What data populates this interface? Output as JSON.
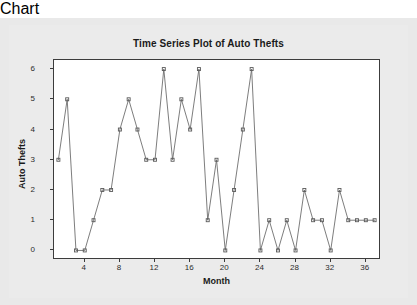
{
  "chart_data": {
    "type": "line",
    "title": "Time Series Plot of Auto Thefts",
    "xlabel": "Month",
    "ylabel": "Auto Thefts",
    "x": [
      1,
      2,
      3,
      4,
      5,
      6,
      7,
      8,
      9,
      10,
      11,
      12,
      13,
      14,
      15,
      16,
      17,
      18,
      19,
      20,
      21,
      22,
      23,
      24,
      25,
      26,
      27,
      28,
      29,
      30,
      31,
      32,
      33,
      34,
      35,
      36,
      37
    ],
    "values": [
      3,
      5,
      0,
      0,
      1,
      2,
      2,
      4,
      5,
      4,
      3,
      3,
      6,
      3,
      5,
      4,
      6,
      1,
      3,
      0,
      2,
      4,
      6,
      0,
      1,
      0,
      1,
      0,
      2,
      1,
      1,
      0,
      2,
      1,
      1,
      1,
      1
    ],
    "series": [
      {
        "name": "Auto Thefts",
        "values": [
          3,
          5,
          0,
          0,
          1,
          2,
          2,
          4,
          5,
          4,
          3,
          3,
          6,
          3,
          5,
          4,
          6,
          1,
          3,
          0,
          2,
          4,
          6,
          0,
          1,
          0,
          1,
          0,
          2,
          1,
          1,
          0,
          2,
          1,
          1,
          1,
          1
        ]
      }
    ],
    "xlim": [
      0.5,
      37.5
    ],
    "ylim": [
      -0.25,
      6.3
    ],
    "xticks": [
      4,
      8,
      12,
      16,
      20,
      24,
      28,
      32,
      36
    ],
    "yticks": [
      0,
      1,
      2,
      3,
      4,
      5,
      6
    ],
    "xtick_labels": [
      "4",
      "8",
      "12",
      "16",
      "20",
      "24",
      "28",
      "32",
      "36"
    ],
    "ytick_labels": [
      "0",
      "1",
      "2",
      "3",
      "4",
      "5",
      "6"
    ],
    "grid": false,
    "legend": false,
    "marker": "square",
    "line_color": "#6e6e6e",
    "marker_color": "#5a5a5a",
    "plot_bg": "#ffffff",
    "figure_bg": "#e9e9e9",
    "axis_color": "#3c3c3c"
  }
}
